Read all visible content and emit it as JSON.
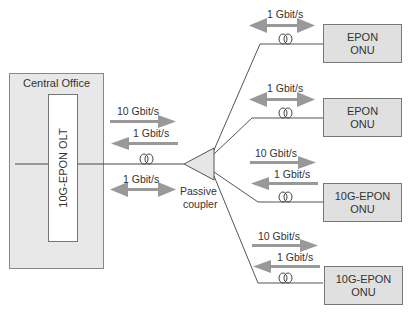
{
  "central_office": {
    "title": "Central Office",
    "olt_label": "10G-EPON OLT"
  },
  "coupler": {
    "label_line1": "Passive",
    "label_line2": "coupler"
  },
  "trunk": {
    "down_rate": "10 Gbit/s",
    "up_rate": "1 Gbit/s",
    "bidir_rate": "1 Gbit/s"
  },
  "onus": [
    {
      "line1": "EPON",
      "line2": "ONU",
      "rate": "1 Gbit/s"
    },
    {
      "line1": "EPON",
      "line2": "ONU",
      "rate": "1 Gbit/s"
    },
    {
      "line1": "10G-EPON",
      "line2": "ONU",
      "down_rate": "10 Gbit/s",
      "up_rate": "1 Gbit/s"
    },
    {
      "line1": "10G-EPON",
      "line2": "ONU",
      "down_rate": "10 Gbit/s",
      "up_rate": "1 Gbit/s"
    }
  ]
}
